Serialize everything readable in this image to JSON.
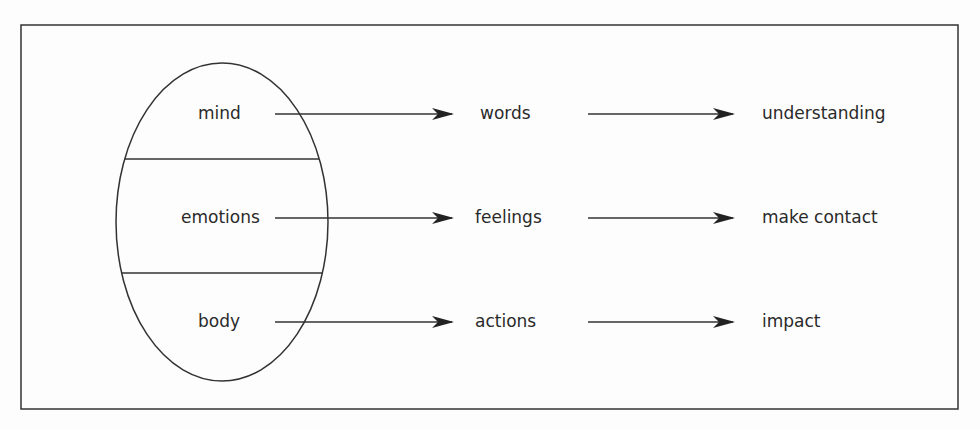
{
  "diagram": {
    "type": "flow",
    "source_shape": "ellipse divided into three sections",
    "rows": [
      {
        "source": "mind",
        "middle": "words",
        "target": "understanding"
      },
      {
        "source": "emotions",
        "middle": "feelings",
        "target": "make contact"
      },
      {
        "source": "body",
        "middle": "actions",
        "target": "impact"
      }
    ],
    "colors": {
      "line": "#333333",
      "background": "#fdfdfd",
      "text": "#2a2a2a"
    }
  }
}
